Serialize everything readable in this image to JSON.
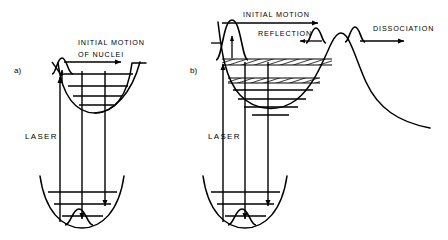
{
  "figure": {
    "background_color": "#ffffff",
    "line_color": "#000000",
    "width": 448,
    "height": 240
  },
  "panels": [
    {
      "id": "a",
      "marker": "a)",
      "labels": {
        "motion_line1": "INITIAL   MOTION",
        "motion_line2": "OF   NUCLEI",
        "laser": "LASER"
      },
      "upper_surface": {
        "type": "bound-harmonic-well",
        "vibrational_levels": 4
      },
      "lower_surface": {
        "type": "bound-harmonic-well",
        "vibrational_levels": 3
      },
      "wavepackets": [
        {
          "name": "excited-state-wavepacket",
          "location": "upper-well-left-wall"
        },
        {
          "name": "ground-state-wavepacket",
          "location": "lower-well-bottom"
        }
      ],
      "transitions": [
        {
          "name": "laser-excitation",
          "direction": "up"
        },
        {
          "name": "emission-1",
          "direction": "down"
        },
        {
          "name": "emission-2",
          "direction": "down"
        }
      ]
    },
    {
      "id": "b",
      "marker": "b)",
      "labels": {
        "motion": "INITIAL   MOTION",
        "reflection": "REFLECTION",
        "dissociation": "DISSOCIATION",
        "laser": "LASER"
      },
      "upper_surface": {
        "type": "well-with-barrier-and-dissociative-tail",
        "vibrational_levels": 4,
        "quasi_continuum_bands": 2,
        "band_fill": "hatched"
      },
      "lower_surface": {
        "type": "bound-harmonic-well",
        "vibrational_levels": 3
      },
      "wavepackets": [
        {
          "name": "excited-state-wavepacket",
          "location": "upper-well-left-wall"
        },
        {
          "name": "reflected-wavepacket",
          "location": "barrier-inner-slope"
        },
        {
          "name": "transmitted-wavepacket",
          "location": "barrier-outer-slope"
        },
        {
          "name": "ground-state-wavepacket",
          "location": "lower-well-bottom"
        }
      ],
      "transitions": [
        {
          "name": "laser-excitation",
          "direction": "up"
        },
        {
          "name": "emission-1",
          "direction": "down"
        },
        {
          "name": "emission-2",
          "direction": "down"
        }
      ]
    }
  ]
}
